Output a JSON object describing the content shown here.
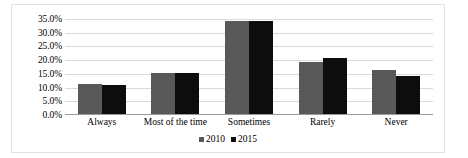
{
  "chart_data": {
    "type": "bar",
    "title": "",
    "xlabel": "",
    "ylabel": "",
    "categories": [
      "Always",
      "Most of the time",
      "Sometimes",
      "Rarely",
      "Never"
    ],
    "series": [
      {
        "name": "2010",
        "color": "#595959",
        "values": [
          11.0,
          15.0,
          34.0,
          19.0,
          16.0
        ]
      },
      {
        "name": "2015",
        "color": "#0d0d0d",
        "values": [
          10.5,
          15.0,
          34.0,
          20.5,
          14.0
        ]
      }
    ],
    "ylim": [
      0,
      35
    ],
    "ytick_labels": [
      "35.0%",
      "30.0%",
      "25.0%",
      "20.0%",
      "15.0%",
      "10.0%",
      "5.0%",
      "0.0%"
    ],
    "ytick_values": [
      35,
      30,
      25,
      20,
      15,
      10,
      5,
      0
    ],
    "grid": true,
    "legend_position": "bottom"
  }
}
